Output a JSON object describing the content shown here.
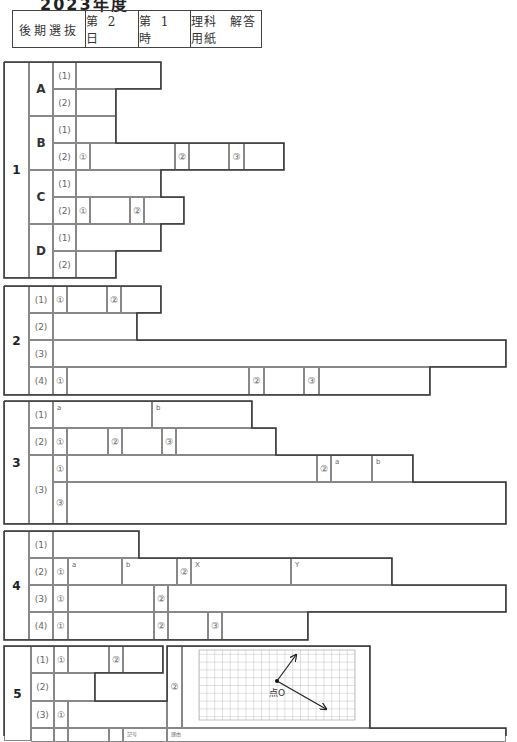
{
  "title_fragment": "2023年度",
  "header": {
    "cells": [
      "後期選抜",
      "第 2 日",
      "第 1 時",
      "理科　解答用紙"
    ]
  },
  "labels": {
    "sub1": "(1)",
    "sub2": "(2)",
    "sub3": "(3)",
    "sub4": "(4)",
    "c1": "①",
    "c2": "②",
    "c3": "③",
    "a": "a",
    "b": "b",
    "X": "X",
    "Y": "Y",
    "kigo": "記号",
    "riyu": "理由",
    "point_o": "点O"
  },
  "sections": [
    {
      "number": "1",
      "groups": [
        "A",
        "B",
        "C",
        "D"
      ]
    },
    {
      "number": "2"
    },
    {
      "number": "3"
    },
    {
      "number": "4"
    },
    {
      "number": "5"
    }
  ]
}
